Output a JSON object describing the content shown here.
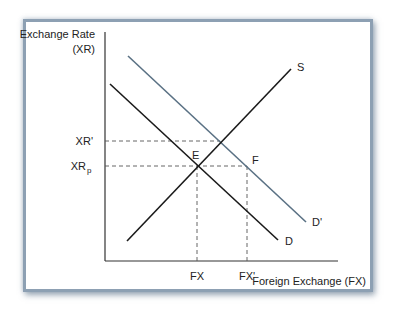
{
  "diagram": {
    "title_y_axis_line1": "Exchange Rate",
    "title_y_axis_line2": "(XR)",
    "x_axis_label": "Foreign Exchange (FX)",
    "y_ticks": {
      "xr_prime": "XR'",
      "xr_p_base": "XR",
      "xr_p_sub": "p"
    },
    "x_ticks": {
      "fx": "FX",
      "fx_prime": "FX'"
    },
    "curves": {
      "supply": {
        "label": "S",
        "color": "#1a1a1a"
      },
      "demand": {
        "label": "D",
        "color": "#1a1a1a"
      },
      "demand_prime": {
        "label": "D'",
        "color": "#5a7184"
      }
    },
    "points": {
      "e": "E",
      "f": "F"
    },
    "frame_color": "#8da0b3"
  }
}
